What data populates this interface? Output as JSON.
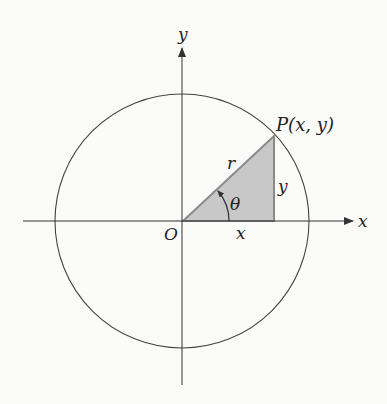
{
  "diagram": {
    "title": "",
    "axes": {
      "x_label": "x",
      "y_label": "y",
      "origin_label": "O"
    },
    "circle": {
      "center": [
        182,
        221
      ],
      "radius": 128
    },
    "point": {
      "label": "P(x, y)"
    },
    "triangle": {
      "hypotenuse_label": "r",
      "opposite_label": "y",
      "adjacent_label": "x",
      "angle_label": "θ",
      "fill_color": "#c8c8c8",
      "edge_color": "#8a8a8a"
    },
    "colors": {
      "line": "#333333",
      "background": "#fbfbfa"
    }
  }
}
